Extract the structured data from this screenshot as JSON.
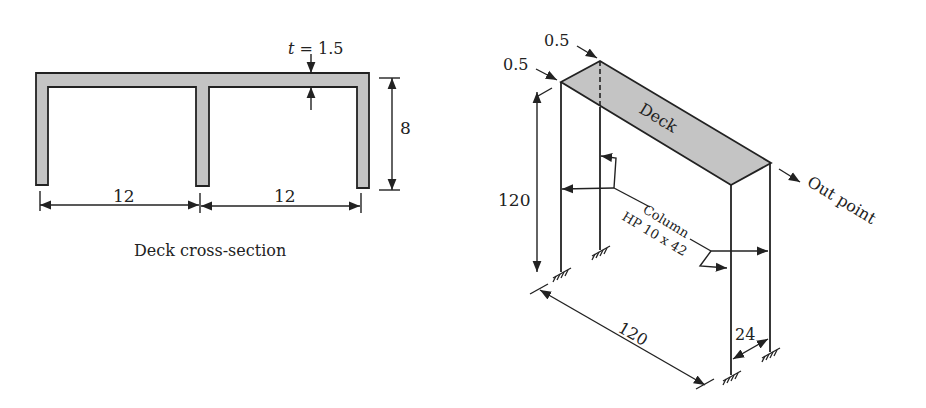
{
  "cross_section": {
    "title": "Deck cross-section",
    "thickness_label": "t = 1.5",
    "thickness_var": "t",
    "thickness_value": "= 1.5",
    "height_label": "8",
    "span_left_label": "12",
    "span_right_label": "12"
  },
  "frame": {
    "deck_label": "Deck",
    "column_label": "Column",
    "column_section": "HP 10 x 42",
    "out_point_label": "Out point",
    "offset_front_label": "0.5",
    "offset_back_label": "0.5",
    "height_label": "120",
    "length_label": "120",
    "width_label": "24"
  },
  "colors": {
    "line": "#222222",
    "fill": "#c4c4c4",
    "background": "#ffffff"
  }
}
